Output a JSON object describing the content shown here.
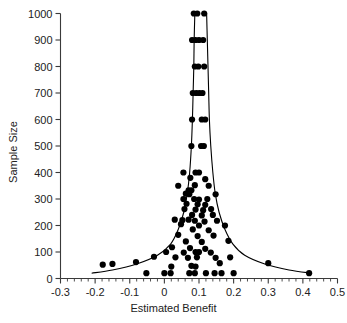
{
  "chart_data": {
    "type": "scatter",
    "title": "",
    "xlabel": "Estimated Benefit",
    "ylabel": "Sample Size",
    "xlim": [
      -0.3,
      0.5
    ],
    "ylim": [
      0,
      1000
    ],
    "xticks": [
      -0.3,
      -0.2,
      -0.1,
      0,
      0.1,
      0.2,
      0.3,
      0.4,
      0.5
    ],
    "xticklabels": [
      "-0.3",
      "-0.2",
      "-0.1",
      "0",
      "0.1",
      "0.2",
      "0.3",
      "0.4",
      "0.5"
    ],
    "yticks": [
      0,
      100,
      200,
      300,
      400,
      500,
      600,
      700,
      800,
      900,
      1000
    ],
    "yticklabels": [
      "0",
      "100",
      "200",
      "300",
      "400",
      "500",
      "600",
      "700",
      "800",
      "900",
      "1000"
    ],
    "x_minor_tick_step": 0.02,
    "grid": false,
    "legend": null,
    "marker": "filled-circle",
    "marker_color": "#000000",
    "marker_size": 3.1,
    "axis_color": "#3a3a3a",
    "background_color": "#ffffff",
    "points": [
      {
        "x": 0.085,
        "y": 1000
      },
      {
        "x": 0.095,
        "y": 1000
      },
      {
        "x": 0.115,
        "y": 1000
      },
      {
        "x": 0.08,
        "y": 900
      },
      {
        "x": 0.09,
        "y": 900
      },
      {
        "x": 0.1,
        "y": 900
      },
      {
        "x": 0.112,
        "y": 900
      },
      {
        "x": 0.088,
        "y": 800
      },
      {
        "x": 0.098,
        "y": 800
      },
      {
        "x": 0.115,
        "y": 800
      },
      {
        "x": 0.082,
        "y": 700
      },
      {
        "x": 0.092,
        "y": 700
      },
      {
        "x": 0.101,
        "y": 700
      },
      {
        "x": 0.11,
        "y": 700
      },
      {
        "x": 0.08,
        "y": 600
      },
      {
        "x": 0.108,
        "y": 600
      },
      {
        "x": 0.118,
        "y": 600
      },
      {
        "x": 0.078,
        "y": 500
      },
      {
        "x": 0.106,
        "y": 500
      },
      {
        "x": 0.114,
        "y": 500
      },
      {
        "x": 0.055,
        "y": 400
      },
      {
        "x": 0.09,
        "y": 400
      },
      {
        "x": 0.1,
        "y": 400
      },
      {
        "x": 0.075,
        "y": 380
      },
      {
        "x": 0.118,
        "y": 375
      },
      {
        "x": 0.04,
        "y": 350
      },
      {
        "x": 0.088,
        "y": 352
      },
      {
        "x": 0.128,
        "y": 350
      },
      {
        "x": 0.07,
        "y": 333
      },
      {
        "x": 0.078,
        "y": 333
      },
      {
        "x": 0.062,
        "y": 320
      },
      {
        "x": 0.072,
        "y": 318
      },
      {
        "x": 0.148,
        "y": 318
      },
      {
        "x": 0.055,
        "y": 300
      },
      {
        "x": 0.086,
        "y": 300
      },
      {
        "x": 0.1,
        "y": 298
      },
      {
        "x": 0.124,
        "y": 300
      },
      {
        "x": 0.064,
        "y": 282
      },
      {
        "x": 0.096,
        "y": 280
      },
      {
        "x": 0.118,
        "y": 278
      },
      {
        "x": 0.058,
        "y": 262
      },
      {
        "x": 0.09,
        "y": 260
      },
      {
        "x": 0.112,
        "y": 258
      },
      {
        "x": 0.135,
        "y": 262
      },
      {
        "x": 0.08,
        "y": 240
      },
      {
        "x": 0.108,
        "y": 238
      },
      {
        "x": 0.14,
        "y": 240
      },
      {
        "x": 0.03,
        "y": 222
      },
      {
        "x": 0.052,
        "y": 220
      },
      {
        "x": 0.07,
        "y": 222
      },
      {
        "x": 0.088,
        "y": 218
      },
      {
        "x": 0.116,
        "y": 215
      },
      {
        "x": 0.152,
        "y": 218
      },
      {
        "x": 0.048,
        "y": 205
      },
      {
        "x": 0.1,
        "y": 200
      },
      {
        "x": 0.175,
        "y": 200
      },
      {
        "x": 0.082,
        "y": 185
      },
      {
        "x": 0.128,
        "y": 182
      },
      {
        "x": 0.04,
        "y": 165
      },
      {
        "x": 0.096,
        "y": 160
      },
      {
        "x": 0.142,
        "y": 162
      },
      {
        "x": 0.062,
        "y": 140
      },
      {
        "x": 0.108,
        "y": 138
      },
      {
        "x": 0.185,
        "y": 142
      },
      {
        "x": 0.022,
        "y": 118
      },
      {
        "x": 0.074,
        "y": 115
      },
      {
        "x": 0.118,
        "y": 112
      },
      {
        "x": 0.005,
        "y": 100
      },
      {
        "x": 0.056,
        "y": 98
      },
      {
        "x": 0.09,
        "y": 100
      },
      {
        "x": 0.1,
        "y": 100
      },
      {
        "x": 0.134,
        "y": 98
      },
      {
        "x": -0.03,
        "y": 82
      },
      {
        "x": 0.032,
        "y": 80
      },
      {
        "x": 0.068,
        "y": 78
      },
      {
        "x": 0.094,
        "y": 80
      },
      {
        "x": 0.148,
        "y": 78
      },
      {
        "x": 0.19,
        "y": 80
      },
      {
        "x": -0.178,
        "y": 52
      },
      {
        "x": -0.15,
        "y": 55
      },
      {
        "x": -0.082,
        "y": 62
      },
      {
        "x": 0.02,
        "y": 45
      },
      {
        "x": 0.078,
        "y": 48
      },
      {
        "x": 0.09,
        "y": 45
      },
      {
        "x": 0.16,
        "y": 58
      },
      {
        "x": 0.3,
        "y": 58
      },
      {
        "x": -0.052,
        "y": 20
      },
      {
        "x": 0.0,
        "y": 20
      },
      {
        "x": 0.018,
        "y": 20
      },
      {
        "x": 0.072,
        "y": 20
      },
      {
        "x": 0.088,
        "y": 20
      },
      {
        "x": 0.12,
        "y": 20
      },
      {
        "x": 0.145,
        "y": 20
      },
      {
        "x": 0.165,
        "y": 20
      },
      {
        "x": 0.2,
        "y": 20
      },
      {
        "x": 0.418,
        "y": 20
      }
    ],
    "funnel_curve": {
      "description": "pseudo-confidence funnel centred on the pooled estimate",
      "center": 0.102,
      "color": "#000000",
      "line_width": 1.1,
      "left_bound": [
        {
          "x": 0.088,
          "y": 1000
        },
        {
          "x": 0.086,
          "y": 900
        },
        {
          "x": 0.085,
          "y": 800
        },
        {
          "x": 0.083,
          "y": 700
        },
        {
          "x": 0.081,
          "y": 600
        },
        {
          "x": 0.078,
          "y": 500
        },
        {
          "x": 0.073,
          "y": 400
        },
        {
          "x": 0.066,
          "y": 320
        },
        {
          "x": 0.056,
          "y": 250
        },
        {
          "x": 0.04,
          "y": 185
        },
        {
          "x": 0.018,
          "y": 130
        },
        {
          "x": -0.02,
          "y": 88
        },
        {
          "x": -0.08,
          "y": 55
        },
        {
          "x": -0.15,
          "y": 32
        },
        {
          "x": -0.21,
          "y": 20
        }
      ],
      "right_bound": [
        {
          "x": 0.122,
          "y": 1000
        },
        {
          "x": 0.124,
          "y": 900
        },
        {
          "x": 0.126,
          "y": 800
        },
        {
          "x": 0.128,
          "y": 700
        },
        {
          "x": 0.13,
          "y": 600
        },
        {
          "x": 0.134,
          "y": 500
        },
        {
          "x": 0.14,
          "y": 400
        },
        {
          "x": 0.147,
          "y": 320
        },
        {
          "x": 0.158,
          "y": 250
        },
        {
          "x": 0.175,
          "y": 185
        },
        {
          "x": 0.198,
          "y": 130
        },
        {
          "x": 0.232,
          "y": 88
        },
        {
          "x": 0.29,
          "y": 55
        },
        {
          "x": 0.36,
          "y": 32
        },
        {
          "x": 0.425,
          "y": 20
        }
      ]
    }
  }
}
